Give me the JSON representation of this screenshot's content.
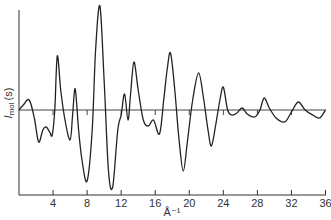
{
  "chart_data": {
    "type": "line",
    "title": "",
    "xlabel": "Å⁻¹",
    "ylabel_main": "I",
    "ylabel_sub": "mol",
    "ylabel_arg": "(s)",
    "xlim": [
      0,
      36
    ],
    "x_ticks": [
      4,
      8,
      12,
      16,
      20,
      24,
      28,
      32,
      36
    ],
    "y_ticks": [],
    "grid": false,
    "legend": null,
    "baseline": 0,
    "series": [
      {
        "name": "I_mol(s)",
        "x": [
          0,
          0.5,
          1.2,
          1.8,
          2.3,
          2.8,
          3.2,
          3.6,
          3.9,
          4.2,
          4.5,
          4.9,
          5.4,
          6.0,
          6.3,
          6.6,
          7.0,
          7.4,
          8.0,
          8.6,
          9.0,
          9.5,
          10.0,
          10.5,
          11.0,
          11.6,
          12.0,
          12.4,
          12.8,
          13.1,
          13.5,
          14.0,
          14.6,
          15.2,
          15.8,
          16.5,
          17.0,
          17.4,
          17.8,
          18.3,
          18.8,
          19.3,
          19.8,
          20.4,
          21.1,
          21.7,
          22.2,
          22.6,
          23.1,
          23.6,
          24.0,
          24.5,
          25.0,
          25.6,
          26.2,
          26.8,
          27.7,
          28.3,
          28.8,
          29.4,
          30.2,
          31.2,
          32.0,
          32.8,
          33.6,
          34.5,
          35.3,
          36.0
        ],
        "y": [
          0,
          5,
          10,
          -8,
          -32,
          -20,
          -17,
          -22,
          -25,
          0,
          54,
          20,
          -10,
          -30,
          -5,
          21,
          -20,
          -50,
          -71,
          -20,
          60,
          104,
          30,
          -60,
          -77,
          -20,
          -5,
          16,
          -10,
          15,
          48,
          20,
          -10,
          -16,
          -10,
          -24,
          10,
          40,
          57,
          20,
          -30,
          -61,
          -30,
          10,
          37,
          10,
          -20,
          -36,
          -15,
          10,
          23,
          0,
          -5,
          -3,
          2,
          -4,
          -7,
          0,
          12,
          2,
          -8,
          -12,
          -2,
          8,
          0,
          -5,
          -8,
          0
        ]
      }
    ]
  }
}
